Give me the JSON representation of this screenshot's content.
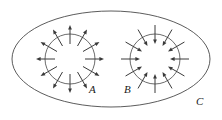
{
  "figure": {
    "background_color": "#ffffff",
    "stroke_color": "#3a3a3a",
    "width": 222,
    "height": 120
  },
  "outer_boundary": {
    "name": "outer-ellipse",
    "label": "C",
    "label_x": 196,
    "label_y": 105,
    "cx": 111,
    "cy": 59,
    "rx": 99,
    "ry": 48,
    "stroke": "#4a4a4a"
  },
  "regions": [
    {
      "name": "source-region",
      "label": "A",
      "label_x": 89,
      "label_y": 93,
      "cx": 70,
      "cy": 59,
      "r": 25,
      "flux_direction": "outward",
      "arrow_count": 12,
      "arrow_inner_radius": 15,
      "arrow_outer_radius": 34,
      "angle_offset_deg": -90
    },
    {
      "name": "sink-region",
      "label": "B",
      "label_x": 124,
      "label_y": 93,
      "cx": 155,
      "cy": 59,
      "r": 25,
      "flux_direction": "inward",
      "arrow_count": 12,
      "arrow_inner_radius": 15,
      "arrow_outer_radius": 34,
      "angle_offset_deg": -90
    }
  ],
  "legend": {
    "source_description": "Arrows point outward from A",
    "sink_description": "Arrows point inward toward B",
    "boundary_description": "Ellipse C encloses both A and B"
  }
}
